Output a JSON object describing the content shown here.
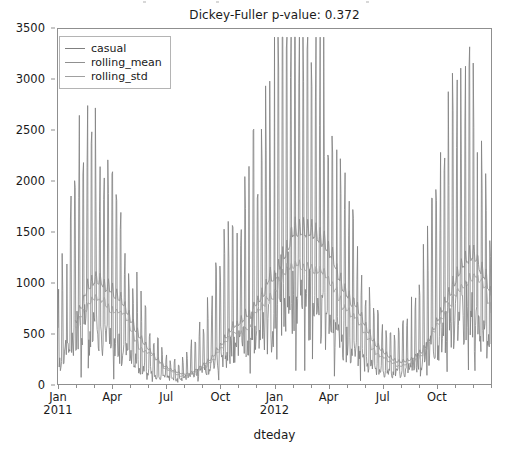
{
  "chart_data": {
    "type": "line",
    "title": "Dickey-Fuller p-value: 0.372",
    "xlabel": "dteday",
    "ylabel": "",
    "grid": false,
    "legend_position": "upper left",
    "ylim": [
      0,
      3500
    ],
    "yticks": [
      0,
      500,
      1000,
      1500,
      2000,
      2500,
      3000,
      3500
    ],
    "ytick_labels": [
      "0",
      "500",
      "1000",
      "1500",
      "2000",
      "2500",
      "3000",
      "3500"
    ],
    "xlim": [
      "2011-01-01",
      "2012-12-31"
    ],
    "xticks": [
      "2011-01",
      "2011-04",
      "2011-07",
      "2011-10",
      "2012-01",
      "2012-04",
      "2012-07",
      "2012-10"
    ],
    "xtick_labels": [
      "Jan\n2011",
      "Apr",
      "Jul",
      "Oct",
      "Jan\n2012",
      "Apr",
      "Jul",
      "Oct"
    ],
    "series": [
      {
        "name": "casual",
        "color": "#7f7f7f",
        "linewidth": 0.8,
        "description": "Daily casual bike-share ridership, 2011-01-01 through 2012-12-31, strong summer seasonality with dense day-to-day spikes",
        "values": [
          331,
          131,
          120,
          108,
          82,
          88,
          148,
          68,
          54,
          41,
          43,
          25,
          38,
          54,
          222,
          251,
          117,
          9,
          78,
          83,
          75,
          93,
          150,
          86,
          186,
          34,
          15,
          38,
          123,
          140,
          42,
          47,
          72,
          61,
          88,
          100,
          354,
          120,
          64,
          53,
          47,
          149,
          288,
          397,
          106,
          73,
          86,
          91,
          77,
          78,
          66,
          64,
          47,
          55,
          61,
          89,
          131,
          114,
          144,
          104,
          97,
          150,
          88,
          183,
          63,
          156,
          166,
          95,
          98,
          139,
          150,
          230,
          170,
          102,
          80,
          56,
          208,
          158,
          148,
          162,
          183,
          166,
          188,
          143,
          159,
          115,
          91,
          129,
          203,
          366,
          323,
          240,
          148,
          158,
          192,
          272,
          217,
          165,
          234,
          156,
          122,
          77,
          140,
          129,
          302,
          446,
          380,
          191,
          129,
          194,
          190,
          164,
          213,
          203,
          118,
          171,
          225,
          301,
          438,
          510,
          428,
          439,
          440,
          426,
          309,
          279,
          337,
          242,
          251,
          292,
          428,
          488,
          471,
          398,
          311,
          318,
          374,
          474,
          440,
          494,
          457,
          347,
          294,
          382,
          447,
          464,
          457,
          408,
          354,
          281,
          343,
          383,
          534,
          558,
          466,
          463,
          444,
          393,
          349,
          446,
          541,
          630,
          659,
          612,
          565,
          522,
          488,
          454,
          533,
          648,
          701,
          685,
          587,
          538,
          511,
          563,
          617,
          648,
          695,
          721,
          665,
          578,
          524,
          492,
          585,
          660,
          742,
          766,
          1105,
          1150,
          1074,
          1011,
          887,
          746,
          829,
          976,
          1117,
          1212,
          1174,
          1046,
          912,
          823,
          893,
          1018,
          1111,
          1203,
          1163,
          1055,
          934,
          845,
          797,
          876,
          997,
          1105,
          1184,
          1146,
          1039,
          924,
          862,
          803,
          887,
          1003,
          1074,
          1130,
          1083,
          992,
          881,
          1510,
          1453,
          1323,
          1200,
          1124,
          1085,
          1183,
          1309,
          1435,
          1498,
          1420,
          1284,
          1152,
          1079,
          1018,
          1135,
          1260,
          1372,
          1429,
          1367,
          1235,
          1108,
          1035,
          982,
          1068,
          1184,
          1291,
          1354,
          1298,
          1169,
          1048,
          968,
          918,
          1004,
          1112,
          1218,
          1278,
          1225,
          1105,
          989,
          911,
          860,
          938,
          1043,
          1142,
          1199,
          1150,
          1038,
          929,
          856,
          807,
          879,
          975,
          1066,
          1119,
          1073,
          968,
          866,
          798,
          752,
          819,
          908,
          993,
          1042,
          999,
          901,
          807,
          743,
          700,
          762,
          846,
          924,
          970,
          930,
          838,
          750,
          690,
          650,
          708,
          785,
          858,
          901,
          864,
          779,
          697,
          641,
          604,
          658,
          730,
          798,
          838,
          803,
          724,
          648,
          596,
          561,
          611,
          678,
          741,
          778,
          746,
          673,
          602,
          554,
          521,
          567,
          629,
          688,
          722,
          693,
          625,
          559,
          514,
          484,
          527,
          584,
          639,
          671,
          643,
          580,
          519,
          477,
          449,
          489,
          542,
          593,
          623,
          597,
          538,
          482,
          443,
          417,
          454,
          503,
          550,
          578,
          554,
          500,
          447,
          411,
          387,
          421,
          467,
          511,
          536,
          514,
          464,
          415,
          382,
          359,
          391,
          433,
          474,
          498,
          477,
          430,
          385,
          354,
          333,
          363,
          402,
          440,
          462,
          443,
          399,
          357,
          329,
          309,
          337,
          373,
          408,
          429,
          411,
          371,
          332,
          305,
          287,
          312,
          346,
          379,
          398,
          382,
          344,
          308,
          283,
          266,
          290,
          321,
          351,
          369,
          354,
          319,
          286,
          263,
          247,
          269,
          298,
          326,
          342,
          329,
          296,
          265,
          244,
          229,
          250,
          277,
          303,
          318,
          305,
          275,
          246,
          227,
          213,
          232,
          257,
          281,
          295,
          283,
          255,
          229,
          210,
          198,
          215,
          238,
          261,
          274,
          263,
          237,
          212,
          195,
          184,
          200,
          221,
          242,
          254,
          244,
          220,
          197,
          181,
          170,
          186,
          206,
          225,
          236,
          227,
          204,
          183,
          168,
          158,
          172,
          191,
          209,
          219,
          210,
          190,
          170,
          156,
          147,
          160,
          177,
          194,
          203,
          195,
          176,
          158,
          145,
          136,
          148,
          164,
          180,
          189,
          181,
          163,
          146,
          135,
          127,
          138,
          153,
          167,
          175,
          168,
          152
        ]
      },
      {
        "name": "rolling_mean",
        "color": "#909090",
        "linewidth": 0.9,
        "description": "Rolling mean of casual ridership; smooth seasonal curve peaking ~1400-1500 in summer 2012"
      },
      {
        "name": "rolling_std",
        "color": "#a0a0a0",
        "linewidth": 0.9,
        "description": "Rolling standard deviation of casual ridership; lower smooth curve peaking ~700-800"
      }
    ],
    "annotations": []
  },
  "chart": {
    "title": "Dickey-Fuller p-value: 0.372",
    "xlabel": "dteday"
  },
  "legend": {
    "entries": [
      {
        "label": "casual",
        "color": "#7f7f7f"
      },
      {
        "label": "rolling_mean",
        "color": "#909090"
      },
      {
        "label": "rolling_std",
        "color": "#a0a0a0"
      }
    ]
  },
  "yaxis": {
    "labels": [
      "3500",
      "3000",
      "2500",
      "2000",
      "1500",
      "1000",
      "500",
      "0"
    ]
  },
  "xaxis": {
    "labels": [
      "Jan\n2011",
      "Apr",
      "Jul",
      "Oct",
      "Jan\n2012",
      "Apr",
      "Jul",
      "Oct"
    ]
  }
}
